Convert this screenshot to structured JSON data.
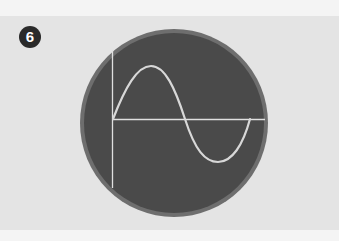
{
  "step": {
    "number": "6"
  },
  "diagram": {
    "colors": {
      "screen": "#4a4a4a",
      "rim": "#6e6e6e",
      "trace": "#d8d8d8",
      "axes": "#e0e0e0",
      "background": "#e4e4e4",
      "badge": "#2a2a2a"
    },
    "waveform": "sine",
    "cycles": 1
  }
}
